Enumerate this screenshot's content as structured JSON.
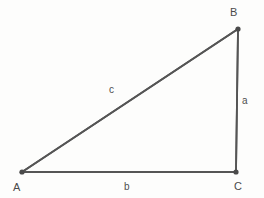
{
  "figure": {
    "kind": "right-triangle-geometry-diagram",
    "background_color": "#fdfdfc",
    "stroke_color": "#555555",
    "vertex_dot_color": "#4a4a4a",
    "text_color": "#4a4a4a"
  },
  "vertices": {
    "A": {
      "label": "A",
      "x": 22,
      "y": 172
    },
    "B": {
      "label": "B",
      "x": 238,
      "y": 29
    },
    "C": {
      "label": "C",
      "x": 236,
      "y": 172
    }
  },
  "sides": {
    "a": {
      "label": "a",
      "from": "B",
      "to": "C",
      "label_x": 245,
      "label_y": 101
    },
    "b": {
      "label": "b",
      "from": "A",
      "to": "C",
      "label_x": 127,
      "label_y": 187
    },
    "c": {
      "label": "c",
      "from": "A",
      "to": "B",
      "label_x": 113,
      "label_y": 90
    }
  },
  "geometry": {
    "path_points": "22,172 238,29 236,172",
    "stroke_width": 1.8,
    "vertex_radius": 2.6
  }
}
